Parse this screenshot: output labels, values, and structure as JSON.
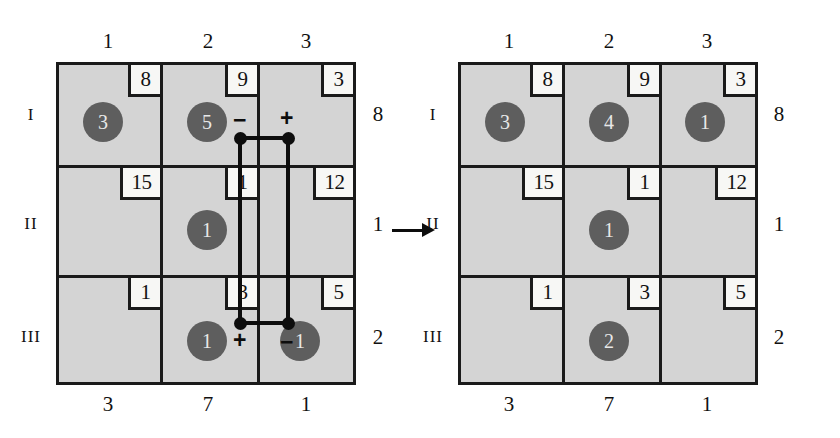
{
  "figure": {
    "caption": "",
    "transform_arrow": "→"
  },
  "grids": [
    {
      "id": "before",
      "col_labels_top": [
        "1",
        "2",
        "3"
      ],
      "col_labels_bottom": [
        "3",
        "7",
        "1"
      ],
      "row_labels_left": [
        "I",
        "II",
        "III"
      ],
      "row_labels_right": [
        "8",
        "1",
        "2"
      ],
      "corner_values": [
        [
          "8",
          "9",
          "3"
        ],
        [
          "15",
          "1",
          "12"
        ],
        [
          "1",
          "3",
          "5"
        ]
      ],
      "tokens": [
        {
          "row": 0,
          "col": 0,
          "value": "3"
        },
        {
          "row": 0,
          "col": 1,
          "value": "5"
        },
        {
          "row": 1,
          "col": 1,
          "value": "1"
        },
        {
          "row": 2,
          "col": 1,
          "value": "1"
        },
        {
          "row": 2,
          "col": 2,
          "value": "1"
        }
      ],
      "loop_signs": {
        "top_left": "−",
        "top_right": "+",
        "bottom_left": "+",
        "bottom_right": "−"
      }
    },
    {
      "id": "after",
      "col_labels_top": [
        "1",
        "2",
        "3"
      ],
      "col_labels_bottom": [
        "3",
        "7",
        "1"
      ],
      "row_labels_left": [
        "I",
        "II",
        "III"
      ],
      "row_labels_right": [
        "8",
        "1",
        "2"
      ],
      "corner_values": [
        [
          "8",
          "9",
          "3"
        ],
        [
          "15",
          "1",
          "12"
        ],
        [
          "1",
          "3",
          "5"
        ]
      ],
      "tokens": [
        {
          "row": 0,
          "col": 0,
          "value": "3"
        },
        {
          "row": 0,
          "col": 1,
          "value": "4"
        },
        {
          "row": 0,
          "col": 2,
          "value": "1"
        },
        {
          "row": 1,
          "col": 1,
          "value": "1"
        },
        {
          "row": 2,
          "col": 1,
          "value": "2"
        }
      ],
      "loop_signs": null
    }
  ],
  "colors": {
    "cell_fill": "#d4d4d4",
    "valbox_fill": "#f7f7f5",
    "line": "#1a1a1a",
    "token_fill": "#5e5e5e",
    "token_text": "#e8e8e8",
    "loop": "#0d0d0d",
    "background": "#ffffff"
  }
}
